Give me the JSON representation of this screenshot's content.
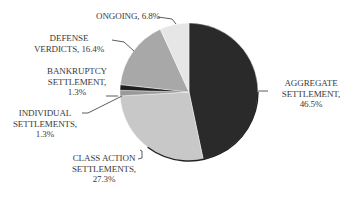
{
  "chart_data": {
    "type": "pie",
    "title": "",
    "start_angle_deg": 0,
    "direction": "clockwise",
    "legend": "none",
    "slices": [
      {
        "label": "AGGREGATE SETTLEMENT",
        "value": 46.5,
        "color": "#2a2a2a"
      },
      {
        "label": "CLASS ACTION SETTLEMENTS",
        "value": 27.3,
        "color": "#c8c8c8"
      },
      {
        "label": "INDIVIDUAL SETTLEMENTS",
        "value": 1.3,
        "color": "#9a9a9a"
      },
      {
        "label": "BANKRUPTCY SETTLEMENT",
        "value": 1.3,
        "color": "#1e1e1e"
      },
      {
        "label": "DEFENSE VERDICTS",
        "value": 16.4,
        "color": "#a8a8a8"
      },
      {
        "label": "ONGOING",
        "value": 6.8,
        "color": "#e6e6e6"
      }
    ]
  },
  "labels": {
    "aggregate": "AGGREGATE\nSETTLEMENT,\n46.5%",
    "class_action": "CLASS ACTION\nSETTLEMENTS,\n27.3%",
    "individual": "INDIVIDUAL\nSETTLEMENTS,\n1.3%",
    "bankruptcy": "BANKRUPTCY\nSETTLEMENT,\n1.3%",
    "defense": "DEFENSE\nVERDICTS, 16.4%",
    "ongoing": "ONGOING, 6.8%"
  }
}
